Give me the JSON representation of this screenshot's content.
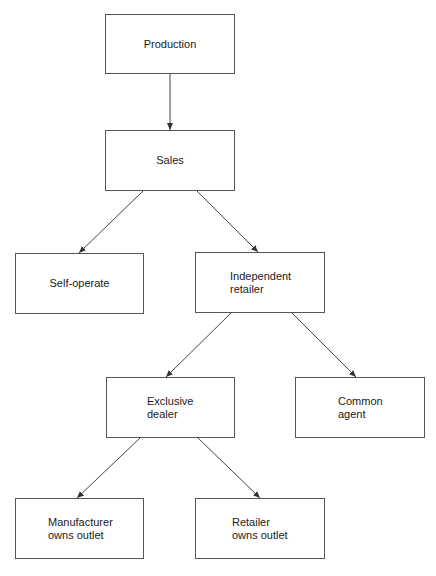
{
  "diagram": {
    "type": "hierarchy",
    "nodes": {
      "production": {
        "label": "Production"
      },
      "sales": {
        "label": "Sales"
      },
      "self_operate": {
        "label": "Self-operate"
      },
      "independent_retailer": {
        "label": "Independent\nretailer"
      },
      "exclusive_dealer": {
        "label": "Exclusive\ndealer"
      },
      "common_agent": {
        "label": "Common\nagent"
      },
      "manufacturer_owns_outlet": {
        "label": "Manufacturer\nowns outlet"
      },
      "retailer_owns_outlet": {
        "label": "Retailer\nowns outlet"
      }
    },
    "edges": [
      {
        "from": "production",
        "to": "sales"
      },
      {
        "from": "sales",
        "to": "self_operate"
      },
      {
        "from": "sales",
        "to": "independent_retailer"
      },
      {
        "from": "independent_retailer",
        "to": "exclusive_dealer"
      },
      {
        "from": "independent_retailer",
        "to": "common_agent"
      },
      {
        "from": "exclusive_dealer",
        "to": "manufacturer_owns_outlet"
      },
      {
        "from": "exclusive_dealer",
        "to": "retailer_owns_outlet"
      }
    ],
    "colors": {
      "line": "#444444",
      "border": "#555555",
      "text": "#1a1a1a",
      "background": "#ffffff"
    }
  }
}
